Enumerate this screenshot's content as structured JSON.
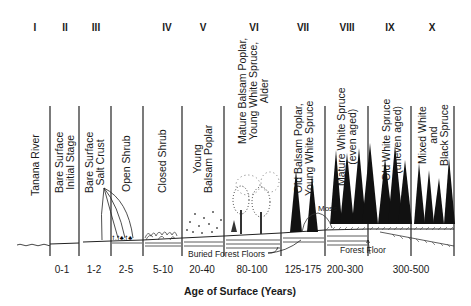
{
  "stages": [
    {
      "numeral": "I",
      "label": "Tanana River",
      "age": "0-1"
    },
    {
      "numeral": "II",
      "label": "Bare Surface\nInitial Stage",
      "age": "1-2"
    },
    {
      "numeral": "III",
      "label": "Bare Surface\nSalt Crust",
      "age": "2-5"
    },
    {
      "numeral": "IV",
      "label": "Open Shrub",
      "age": "5-10"
    },
    {
      "numeral": "V",
      "label": "Closed Shrub",
      "age": "20-40"
    },
    {
      "numeral": "VI",
      "label": "Young\nBalsam Poplar",
      "age": "80-100"
    },
    {
      "numeral": "VII",
      "label": "Mature Balsam Poplar,\nYoung White Spruce,\nAlder",
      "age": "125-175"
    },
    {
      "numeral": "VIII",
      "label": "Old Balsam Poplar,\nYoung White Spruce",
      "age": "200-300"
    },
    {
      "numeral": "IX",
      "label": "Mature White Spruce\n(even aged)",
      "age": "300-500"
    },
    {
      "numeral": "X",
      "label": "Old White Spruce\n(uneven aged)",
      "age": ""
    },
    {
      "numeral": "",
      "label": "Mixed White\nand\nBlack Spruce",
      "age": ""
    }
  ],
  "numerals": [
    "I",
    "II",
    "III",
    "IV",
    "V",
    "VI",
    "VII",
    "VIII",
    "IX",
    "X"
  ],
  "labels": {
    "tanana": "Tanana River",
    "bare_initial": "Bare Surface\nInitial Stage",
    "bare_salt": "Bare Surface\nSalt Crust",
    "open_shrub": "Open Shrub",
    "closed_shrub": "Closed Shrub",
    "young_poplar": "Young\nBalsam Poplar",
    "mature_poplar": "Mature Balsam Poplar,\nYoung White Spruce,\nAlder",
    "old_poplar": "Old Balsam Poplar,\nYoung White Spruce",
    "mature_spruce": "Mature White Spruce\n(even aged)",
    "old_spruce": "Old White Spruce\n(uneven aged)",
    "mixed_spruce": "Mixed White\nand\nBlack Spruce"
  },
  "ages": [
    "0-1",
    "1-2",
    "2-5",
    "5-10",
    "20-40",
    "80-100",
    "125-175",
    "200-300",
    "300-500"
  ],
  "annotations": {
    "buried_forest_floors": "Buried Forest Floors",
    "moss": "Moss",
    "forest_floor": "Forest Floor"
  },
  "axis_title": "Age of Surface (Years)"
}
